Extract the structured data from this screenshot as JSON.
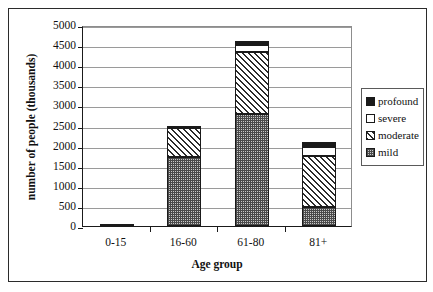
{
  "chart_data": {
    "type": "bar",
    "subtype": "stacked-vertical",
    "title": "",
    "xlabel": "Age group",
    "ylabel": "number of people (thousands)",
    "categories": [
      "0-15",
      "16-60",
      "61-80",
      "81+"
    ],
    "ylim": [
      0,
      5000
    ],
    "yticks": [
      0,
      500,
      1000,
      1500,
      2000,
      2500,
      3000,
      3500,
      4000,
      4500,
      5000
    ],
    "ytick_labels": [
      "0",
      "500",
      "1000",
      "1500",
      "2000",
      "2500",
      "3000",
      "3500",
      "4000",
      "4500",
      "5000"
    ],
    "grid": "horizontal",
    "legend_position": "right",
    "series": [
      {
        "name": "mild",
        "values": [
          50,
          1725,
          2775,
          475
        ]
      },
      {
        "name": "moderate",
        "values": [
          0,
          725,
          1550,
          1275
        ]
      },
      {
        "name": "severe",
        "values": [
          0,
          0,
          175,
          225
        ]
      },
      {
        "name": "profound",
        "values": [
          0,
          50,
          100,
          125
        ]
      }
    ],
    "totals": [
      50,
      2500,
      4600,
      2100
    ],
    "stack_order_bottom_to_top": [
      "mild",
      "moderate",
      "severe",
      "profound"
    ]
  },
  "legend": {
    "items": [
      {
        "label": "profound",
        "swatch": "solid-black-swatch"
      },
      {
        "label": "severe",
        "swatch": "white-swatch"
      },
      {
        "label": "moderate",
        "swatch": "diagonal-hatch-swatch"
      },
      {
        "label": "mild",
        "swatch": "stippled-swatch"
      }
    ]
  }
}
